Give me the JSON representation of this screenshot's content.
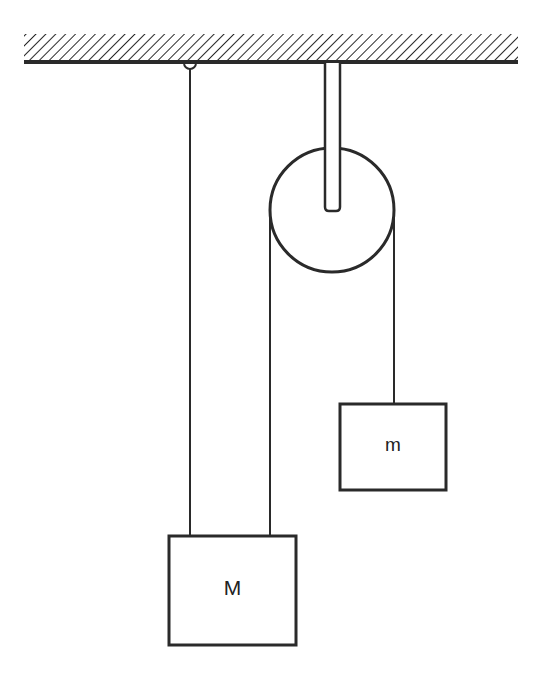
{
  "diagram": {
    "type": "pulley system",
    "colors": {
      "line": "#2a2a2a",
      "background": "#ffffff"
    },
    "ceiling": {
      "label": "fixed support (hatched)"
    },
    "pulley": {
      "label": "fixed pulley on rod"
    },
    "blocks": [
      {
        "id": "M",
        "label": "M"
      },
      {
        "id": "m",
        "label": "m"
      }
    ]
  }
}
